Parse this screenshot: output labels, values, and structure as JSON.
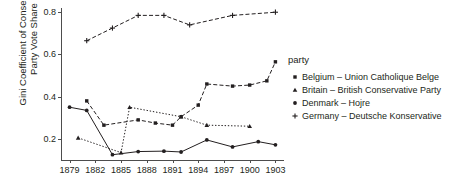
{
  "chart_data": {
    "type": "line",
    "title": "",
    "xlabel": "",
    "ylabel": "Gini Coefficient of Conservative\nParty Vote Share",
    "legend_title": "party",
    "legend_position": "right",
    "grid": false,
    "xlim": [
      1878,
      1904
    ],
    "ylim": [
      0.1,
      0.82
    ],
    "xticks": [
      1879,
      1882,
      1885,
      1888,
      1891,
      1894,
      1897,
      1900,
      1903
    ],
    "xtick_labels": [
      "1879",
      "1882",
      "1885",
      "1888",
      "1891",
      "1894",
      "1897",
      "1900",
      "1903"
    ],
    "yticks": [
      0.2,
      0.4,
      0.6,
      0.8
    ],
    "ytick_labels": [
      "0.2",
      "0.4",
      "0.6",
      "0.8"
    ],
    "series": [
      {
        "name": "Belgium – Union Catholique Belge",
        "marker": "square",
        "linestyle": "dashed",
        "color": "#231f20",
        "x": [
          1881,
          1883,
          1887,
          1889,
          1891,
          1892,
          1894,
          1895,
          1898,
          1900,
          1902,
          1903
        ],
        "values": [
          0.38,
          0.265,
          0.29,
          0.275,
          0.265,
          0.305,
          0.36,
          0.46,
          0.45,
          0.455,
          0.475,
          0.565
        ]
      },
      {
        "name": "Britain – British Conservative Party",
        "marker": "triangle",
        "linestyle": "dotted",
        "color": "#231f20",
        "x": [
          1880,
          1885,
          1886,
          1892,
          1895,
          1900
        ],
        "values": [
          0.205,
          0.135,
          0.35,
          0.305,
          0.265,
          0.26
        ]
      },
      {
        "name": "Denmark – Hojre",
        "marker": "circle",
        "linestyle": "solid",
        "color": "#231f20",
        "x": [
          1879,
          1881,
          1884,
          1887,
          1890,
          1892,
          1895,
          1898,
          1901,
          1903
        ],
        "values": [
          0.35,
          0.335,
          0.125,
          0.14,
          0.142,
          0.138,
          0.195,
          0.162,
          0.187,
          0.172
        ]
      },
      {
        "name": "Germany – Deutsche Konservative",
        "marker": "plus",
        "linestyle": "dashed",
        "color": "#231f20",
        "x": [
          1881,
          1884,
          1887,
          1890,
          1893,
          1898,
          1903
        ],
        "values": [
          0.665,
          0.725,
          0.785,
          0.785,
          0.74,
          0.785,
          0.8
        ]
      }
    ]
  }
}
